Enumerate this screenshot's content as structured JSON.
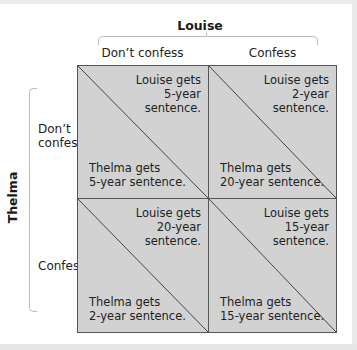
{
  "diagram": {
    "type": "payoff-matrix",
    "column_player": "Louise",
    "row_player": "Thelma",
    "columns": [
      "Don’t confess",
      "Confess"
    ],
    "rows": [
      {
        "label_lines": [
          "Don’t",
          "confess"
        ]
      },
      {
        "label_lines": [
          "Confess"
        ]
      }
    ],
    "cells": [
      [
        {
          "louise": [
            "Louise gets",
            "5-year",
            "sentence."
          ],
          "thelma": [
            "Thelma gets",
            "5-year sentence."
          ]
        },
        {
          "louise": [
            "Louise gets",
            "2-year",
            "sentence."
          ],
          "thelma": [
            "Thelma gets",
            "20-year sentence."
          ]
        }
      ],
      [
        {
          "louise": [
            "Louise gets",
            "20-year",
            "sentence."
          ],
          "thelma": [
            "Thelma gets",
            "2-year sentence."
          ]
        },
        {
          "louise": [
            "Louise gets",
            "15-year",
            "sentence."
          ],
          "thelma": [
            "Thelma gets",
            "15-year sentence."
          ]
        }
      ]
    ],
    "colors": {
      "cell_fill": "#d2d2d2",
      "grid_line": "#555555",
      "brace": "#bbbbbb"
    }
  }
}
